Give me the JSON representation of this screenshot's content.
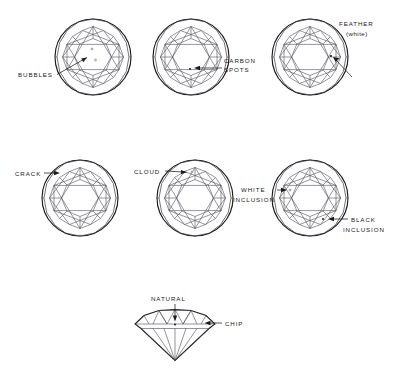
{
  "figure": {
    "background_color": "#ffffff",
    "ink_color": "#1c1c1c",
    "facet_color": "#555560",
    "view_box": "0 0 399 377"
  },
  "rows": [
    {
      "name": "top-row",
      "stones": [
        {
          "id": "stone-bubbles",
          "view": "round-brilliant-top",
          "cx": 93,
          "cy": 57,
          "r": 38,
          "label": "BUBBLES",
          "label_x": 18,
          "label_y": 76,
          "leader": {
            "x1": 57,
            "y1": 74,
            "x2": 87,
            "y2": 58
          },
          "flaws": [
            {
              "type": "bubble",
              "x": 92,
              "y": 49,
              "r": 0.9,
              "shade": "light"
            },
            {
              "type": "bubble",
              "x": 95,
              "y": 60,
              "r": 0.9,
              "shade": "light"
            }
          ]
        },
        {
          "id": "stone-carbon-spots",
          "view": "round-brilliant-top",
          "cx": 191,
          "cy": 57,
          "r": 38,
          "label": "CARBON",
          "label2": "SPOTS",
          "label_x": 224,
          "label_y": 62,
          "label2_x": 224,
          "label2_y": 71,
          "leader": {
            "x1": 222,
            "y1": 68,
            "x2": 194,
            "y2": 68
          },
          "flaws": [
            {
              "type": "carbon-spot",
              "x": 191,
              "y": 69,
              "r": 1.0,
              "shade": "dark"
            }
          ]
        },
        {
          "id": "stone-feather",
          "view": "round-brilliant-top",
          "cx": 310,
          "cy": 57,
          "r": 38,
          "label": "FEATHER",
          "label2": "(white)",
          "label_x": 340,
          "label_y": 25,
          "label2_x": 345,
          "label2_y": 35,
          "leader": {
            "x1": 351,
            "y1": 76,
            "x2": 334,
            "y2": 57
          },
          "flaws": [
            {
              "type": "feather",
              "x": 331,
              "y": 56,
              "r": 1.1,
              "shade": "dark"
            }
          ]
        }
      ]
    },
    {
      "name": "middle-row",
      "stones": [
        {
          "id": "stone-crack",
          "view": "round-brilliant-top",
          "cx": 80,
          "cy": 198,
          "r": 38,
          "label": "CRACK",
          "label_x": 20,
          "label_y": 175,
          "leader": {
            "x1": 45,
            "y1": 173,
            "x2": 60,
            "y2": 173
          },
          "flaws": []
        },
        {
          "id": "stone-cloud",
          "view": "round-brilliant-top",
          "cx": 195,
          "cy": 198,
          "r": 38,
          "label": "CLOUD",
          "label_x": 137,
          "label_y": 173,
          "leader": {
            "x1": 167,
            "y1": 172,
            "x2": 188,
            "y2": 172
          },
          "flaws": [
            {
              "type": "cloud",
              "x": 191,
              "y": 172,
              "r": 1.0,
              "shade": "light"
            }
          ]
        },
        {
          "id": "stone-inclusions",
          "view": "round-brilliant-top",
          "cx": 310,
          "cy": 198,
          "r": 38,
          "label": "WHITE",
          "label2": "INCLUSION",
          "label_x": 241,
          "label_y": 192,
          "label2_x": 234,
          "label2_y": 201,
          "leader": {
            "x1": 278,
            "y1": 190,
            "x2": 290,
            "y2": 190
          },
          "label_b": "BLACK",
          "label_b2": "INCLUSION",
          "label_b_x": 350,
          "label_b_y": 222,
          "label_b2_x": 342,
          "label_b2_y": 231,
          "leader_b": {
            "x1": 347,
            "y1": 219,
            "x2": 325,
            "y2": 219
          },
          "flaws": [
            {
              "type": "white-inclusion",
              "x": 291,
              "y": 190,
              "r": 1.0,
              "shade": "light"
            },
            {
              "type": "black-inclusion",
              "x": 322,
              "y": 219,
              "r": 1.0,
              "shade": "dark"
            }
          ]
        }
      ]
    },
    {
      "name": "bottom-row",
      "stones": [
        {
          "id": "stone-natural-chip",
          "view": "round-brilliant-side",
          "cx": 175,
          "cy": 330,
          "label": "NATURAL",
          "label_x": 152,
          "label_y": 301,
          "leader": {
            "x1": 175,
            "y1": 304,
            "x2": 175,
            "y2": 321
          },
          "label_b": "CHIP",
          "label_b_x": 222,
          "label_b_y": 325,
          "leader_b": {
            "x1": 220,
            "y1": 322,
            "x2": 204,
            "y2": 322
          },
          "flaws": [
            {
              "type": "natural",
              "x": 175,
              "y": 324,
              "r": 1.0,
              "shade": "dark"
            }
          ]
        }
      ]
    }
  ],
  "labels_flat": [
    "BUBBLES",
    "CARBON",
    "SPOTS",
    "FEATHER",
    "(white)",
    "CRACK",
    "CLOUD",
    "WHITE",
    "INCLUSION",
    "BLACK",
    "INCLUSION",
    "NATURAL",
    "CHIP"
  ]
}
